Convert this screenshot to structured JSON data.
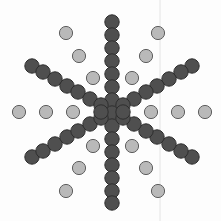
{
  "figure": {
    "width": 221,
    "height": 221,
    "background": "#fdfdfd",
    "guide_line": {
      "x": 160,
      "color": "#e4e4e4"
    },
    "dark_circle": {
      "fill": "#4f4f4f",
      "stroke": "#2e2e2e",
      "radius": 7.2
    },
    "light_circle": {
      "fill": "#b9b9b9",
      "stroke": "#5f5f5f",
      "radius": 6.6
    },
    "dark_points": [
      [
        112,
        22
      ],
      [
        112,
        35
      ],
      [
        112,
        48
      ],
      [
        112,
        61
      ],
      [
        112,
        74
      ],
      [
        112,
        87
      ],
      [
        112,
        100
      ],
      [
        112,
        113
      ],
      [
        112,
        126
      ],
      [
        112,
        139
      ],
      [
        112,
        152
      ],
      [
        112,
        165
      ],
      [
        112,
        178
      ],
      [
        112,
        191
      ],
      [
        112,
        203
      ],
      [
        32,
        66
      ],
      [
        43,
        72
      ],
      [
        55,
        79
      ],
      [
        67,
        86
      ],
      [
        78,
        92
      ],
      [
        90,
        99
      ],
      [
        101,
        105
      ],
      [
        192,
        66
      ],
      [
        181,
        72
      ],
      [
        169,
        79
      ],
      [
        157,
        86
      ],
      [
        146,
        92
      ],
      [
        134,
        99
      ],
      [
        123,
        105
      ],
      [
        32,
        157
      ],
      [
        43,
        151
      ],
      [
        55,
        144
      ],
      [
        67,
        137
      ],
      [
        78,
        131
      ],
      [
        90,
        124
      ],
      [
        101,
        118
      ],
      [
        192,
        157
      ],
      [
        181,
        151
      ],
      [
        169,
        144
      ],
      [
        157,
        137
      ],
      [
        146,
        131
      ],
      [
        134,
        124
      ],
      [
        123,
        118
      ],
      [
        101,
        112
      ],
      [
        123,
        112
      ]
    ],
    "light_points": [
      [
        19,
        112
      ],
      [
        46,
        112
      ],
      [
        73,
        112
      ],
      [
        151,
        112
      ],
      [
        178,
        112
      ],
      [
        205,
        112
      ],
      [
        66,
        33
      ],
      [
        79,
        56
      ],
      [
        93,
        78
      ],
      [
        158,
        33
      ],
      [
        146,
        56
      ],
      [
        132,
        78
      ],
      [
        93,
        146
      ],
      [
        79,
        168
      ],
      [
        66,
        191
      ],
      [
        132,
        146
      ],
      [
        146,
        168
      ],
      [
        158,
        191
      ]
    ]
  }
}
